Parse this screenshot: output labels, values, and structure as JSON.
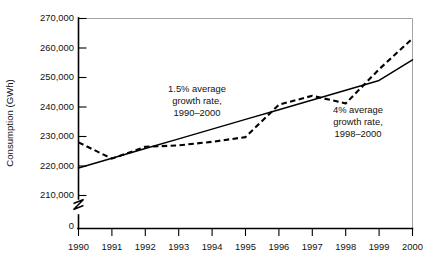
{
  "chart_data": {
    "type": "line",
    "title": "",
    "xlabel": "",
    "ylabel": "Consumption (GWh)",
    "grid": false,
    "legend": "none",
    "axis_break": true,
    "xlim": [
      1990,
      2000
    ],
    "ylim": [
      205000,
      270000
    ],
    "ytick_labels": [
      "270,000",
      "260,000",
      "250,000",
      "240,000",
      "230,000",
      "220,000",
      "210,000"
    ],
    "ytick_values": [
      270000,
      260000,
      250000,
      240000,
      230000,
      220000,
      210000
    ],
    "ytick_zero_label": "0",
    "xtick_labels": [
      "1990",
      "1991",
      "1992",
      "1993",
      "1994",
      "1995",
      "1996",
      "1997",
      "1998",
      "1999",
      "2000"
    ],
    "x": [
      1990,
      1991,
      1992,
      1993,
      1994,
      1995,
      1996,
      1997,
      1998,
      1999,
      2000
    ],
    "series": [
      {
        "name": "Actual consumption",
        "style": "dashed",
        "values": [
          228000,
          222500,
          226500,
          227000,
          228200,
          229800,
          240800,
          243800,
          241200,
          252800,
          263200
        ]
      },
      {
        "name": "1.5% average growth trend",
        "style": "solid",
        "values": [
          219300,
          222600,
          225900,
          229200,
          232500,
          235800,
          239100,
          242400,
          245700,
          249000,
          256000
        ]
      }
    ],
    "annotations": [
      {
        "name": "growth-rate-1990-2000",
        "lines": [
          "1.5% average",
          "growth rate,",
          "1990–2000"
        ],
        "x": 1993.35,
        "y": 244500
      },
      {
        "name": "growth-rate-1998-2000",
        "lines": [
          "4% average",
          "growth rate,",
          "1998–2000"
        ],
        "x": 1998.15,
        "y": 237200
      }
    ]
  }
}
